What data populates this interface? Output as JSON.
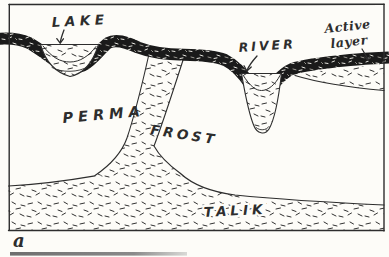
{
  "figure": {
    "kind": "hand-drawn permafrost cross-section diagram",
    "panel_label": "a",
    "labels": {
      "lake": "LAKE",
      "river": "RIVER",
      "active_layer": [
        "Active",
        "layer"
      ],
      "permafrost": [
        "PERMA",
        "FROST"
      ],
      "talik": "TALIK"
    },
    "colors": {
      "paper": "#fdfcf8",
      "ink": "#2d2d2d",
      "frozen_band": "#1a1a1a",
      "stipple": "#303030",
      "scan_bar": "#757575"
    }
  }
}
